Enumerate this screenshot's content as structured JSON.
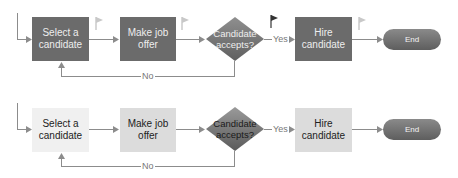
{
  "top_flow": {
    "steps": [
      {
        "label": "Select a candidate",
        "line1": "Select a",
        "line2": "candidate"
      },
      {
        "label": "Make job offer"
      },
      {
        "label": "Hire candidate"
      }
    ],
    "decision": {
      "line1": "Candidate",
      "line2": "accepts?"
    },
    "yes_label": "Yes",
    "no_label": "No",
    "end_label": "End",
    "flags": [
      "flag-light",
      "flag-light",
      "flag-dark",
      "flag-light"
    ]
  },
  "bottom_flow": {
    "steps": [
      {
        "label": "Select a candidate",
        "line1": "Select a",
        "line2": "candidate"
      },
      {
        "label": "Make job offer"
      },
      {
        "label": "Hire candidate"
      }
    ],
    "decision": {
      "line1": "Candidate",
      "line2": "accepts?"
    },
    "yes_label": "Yes",
    "no_label": "No",
    "end_label": "End"
  },
  "colors": {
    "dark_box": "#6b6b6b",
    "light_box": "#f0f0f0",
    "mid_box": "#dcdcdc",
    "connector": "#8c8c8c"
  }
}
